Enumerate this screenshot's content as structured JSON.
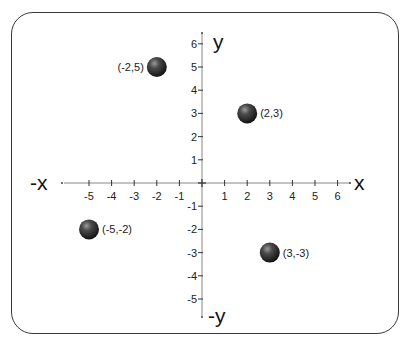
{
  "diagram": {
    "axes": {
      "x_positive_label": "x",
      "x_negative_label": "-x",
      "y_positive_label": "y",
      "y_negative_label": "-y"
    },
    "x_ticks": [
      "-5",
      "-4",
      "-3",
      "-2",
      "-1",
      "1",
      "2",
      "3",
      "4",
      "5",
      "6"
    ],
    "y_ticks": [
      "6",
      "5",
      "4",
      "3",
      "2",
      "1",
      "-1",
      "-2",
      "-3",
      "-4",
      "-5"
    ],
    "points": [
      {
        "label": "(-2,5)",
        "x": -2,
        "y": 5
      },
      {
        "label": "(2,3)",
        "x": 2,
        "y": 3
      },
      {
        "label": "(-5,-2)",
        "x": -5,
        "y": -2
      },
      {
        "label": "(3,-3)",
        "x": 3,
        "y": -3
      }
    ],
    "colors": {
      "axis": "#666666",
      "point": "#333333",
      "frame": "#3a3a3a"
    }
  }
}
